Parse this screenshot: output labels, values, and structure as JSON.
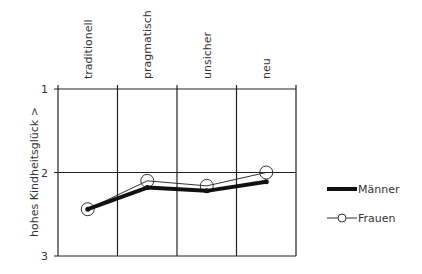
{
  "chart_data": {
    "type": "line",
    "title": "",
    "xlabel": "",
    "ylabel": "hohes Kindheitsglück >",
    "categories": [
      "traditionell",
      "pragmatisch",
      "unsicher",
      "neu"
    ],
    "y_ticks": [
      "1",
      "2",
      "3"
    ],
    "ylim": [
      3,
      1
    ],
    "y_inverted": true,
    "grid": true,
    "legend_position": "right",
    "series": [
      {
        "name": "Männer",
        "values": [
          2.44,
          2.18,
          2.22,
          2.11
        ],
        "style": "thick-line-small-marker",
        "color": "#111111"
      },
      {
        "name": "Frauen",
        "values": [
          2.44,
          2.1,
          2.16,
          2.0
        ],
        "style": "thin-line-circle-marker",
        "color": "#333333"
      }
    ]
  }
}
